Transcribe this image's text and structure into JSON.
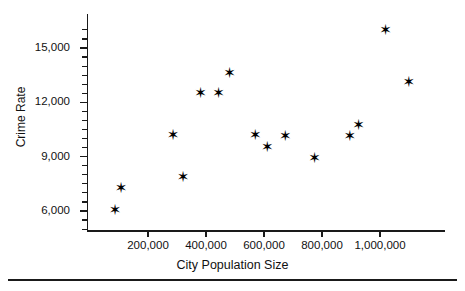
{
  "chart_data": {
    "type": "scatter",
    "title": "",
    "xlabel": "City Population Size",
    "ylabel": "Crime Rate",
    "xlim": [
      0,
      1140000
    ],
    "ylim": [
      4600,
      16600
    ],
    "grid": false,
    "legend": null,
    "marker": "star",
    "marker_color": "#000000",
    "x_tick_labels": [
      "200,000",
      "400,000",
      "600,000",
      "800,000",
      "1,000,000"
    ],
    "x_ticks": [
      200000,
      400000,
      600000,
      800000,
      1000000
    ],
    "y_tick_labels": [
      "6,000",
      "9,000",
      "12,000",
      "15,000"
    ],
    "y_ticks": [
      6000,
      9000,
      12000,
      15000
    ],
    "y_minor_ticks": [
      5000,
      5500,
      6500,
      7000,
      7500,
      8000,
      8500,
      9500,
      10000,
      10500,
      11000,
      11500,
      12500,
      13000,
      13500,
      14000,
      14500,
      15500,
      16000
    ],
    "points": [
      {
        "x": 85000,
        "y": 6050
      },
      {
        "x": 106000,
        "y": 7250
      },
      {
        "x": 285000,
        "y": 10200
      },
      {
        "x": 320000,
        "y": 7850
      },
      {
        "x": 380000,
        "y": 12500
      },
      {
        "x": 442000,
        "y": 12500
      },
      {
        "x": 480000,
        "y": 13600
      },
      {
        "x": 569000,
        "y": 10200
      },
      {
        "x": 610000,
        "y": 9550
      },
      {
        "x": 672000,
        "y": 10150
      },
      {
        "x": 773000,
        "y": 8950
      },
      {
        "x": 895000,
        "y": 10150
      },
      {
        "x": 925000,
        "y": 10750
      },
      {
        "x": 1018000,
        "y": 16000
      },
      {
        "x": 1098000,
        "y": 13100
      }
    ],
    "marker_glyph": "✳"
  }
}
